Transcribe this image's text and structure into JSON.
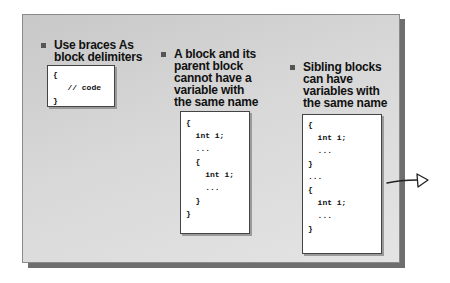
{
  "slide": {
    "bullets": [
      {
        "text": "Use braces  As\nblock delimiters"
      },
      {
        "text": "A block and its\nparent block\ncannot have a\nvariable with\nthe same name"
      },
      {
        "text": "Sibling blocks\ncan have\nvariables with\nthe same name"
      }
    ],
    "code_boxes": [
      {
        "lines": [
          "{",
          "   // code",
          "}"
        ]
      },
      {
        "lines": [
          "{",
          "  int i;",
          "  ...",
          "  {",
          "    int i;",
          "    ...",
          "  }",
          "}"
        ]
      },
      {
        "lines": [
          "{",
          "  int i;",
          "  ...",
          "}",
          "...",
          "{",
          "  int i;",
          "  ...",
          "}"
        ]
      }
    ]
  },
  "annotation": {
    "icon": "hand-drawn-arrow-icon"
  }
}
